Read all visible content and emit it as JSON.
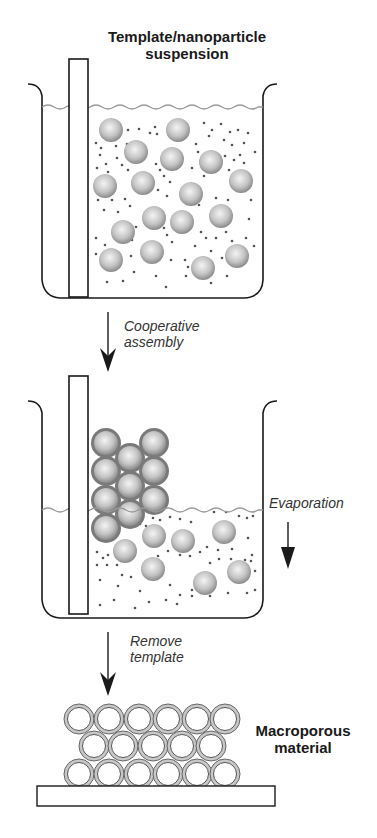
{
  "labels": {
    "suspension_line1": "Template/nanoparticle",
    "suspension_line2": "suspension",
    "step1_line1": "Cooperative",
    "step1_line2": "assembly",
    "evaporation": "Evaporation",
    "step2_line1": "Remove",
    "step2_line2": "template",
    "product_line1": "Macroporous",
    "product_line2": "material"
  },
  "colors": {
    "outline": "#1a1a1a",
    "liquid_surface": "#9a9a9a",
    "sphere_light": "#eeeeee",
    "sphere_dark": "#8c8c8c",
    "shell": "#7a7a7a",
    "dot": "#555555",
    "matrix": "#c8c8c8"
  },
  "beaker1": {
    "spheres": [
      [
        111,
        130
      ],
      [
        178,
        130
      ],
      [
        136,
        152
      ],
      [
        172,
        159
      ],
      [
        211,
        162
      ],
      [
        105,
        186
      ],
      [
        143,
        183
      ],
      [
        191,
        194
      ],
      [
        241,
        181
      ],
      [
        154,
        218
      ],
      [
        182,
        222
      ],
      [
        123,
        232
      ],
      [
        221,
        216
      ],
      [
        152,
        252
      ],
      [
        111,
        260
      ],
      [
        203,
        268
      ],
      [
        237,
        256
      ]
    ],
    "dots": [
      [
        128,
        130
      ],
      [
        139,
        129
      ],
      [
        155,
        127
      ],
      [
        150,
        133
      ],
      [
        157,
        134
      ],
      [
        204,
        123
      ],
      [
        212,
        130
      ],
      [
        221,
        124
      ],
      [
        230,
        132
      ],
      [
        238,
        130
      ],
      [
        248,
        133
      ],
      [
        96,
        143
      ],
      [
        101,
        148
      ],
      [
        116,
        146
      ],
      [
        127,
        144
      ],
      [
        196,
        144
      ],
      [
        209,
        136
      ],
      [
        224,
        140
      ],
      [
        232,
        145
      ],
      [
        244,
        143
      ],
      [
        255,
        152
      ],
      [
        100,
        155
      ],
      [
        106,
        164
      ],
      [
        117,
        158
      ],
      [
        122,
        165
      ],
      [
        156,
        164
      ],
      [
        160,
        170
      ],
      [
        198,
        152
      ],
      [
        225,
        156
      ],
      [
        234,
        160
      ],
      [
        240,
        155
      ],
      [
        244,
        163
      ],
      [
        97,
        168
      ],
      [
        108,
        172
      ],
      [
        128,
        170
      ],
      [
        164,
        176
      ],
      [
        170,
        182
      ],
      [
        192,
        168
      ],
      [
        204,
        176
      ],
      [
        229,
        170
      ],
      [
        98,
        200
      ],
      [
        112,
        200
      ],
      [
        125,
        199
      ],
      [
        130,
        206
      ],
      [
        158,
        190
      ],
      [
        167,
        196
      ],
      [
        199,
        205
      ],
      [
        216,
        198
      ],
      [
        228,
        200
      ],
      [
        251,
        200
      ],
      [
        104,
        210
      ],
      [
        118,
        212
      ],
      [
        126,
        224
      ],
      [
        136,
        227
      ],
      [
        164,
        228
      ],
      [
        167,
        235
      ],
      [
        201,
        232
      ],
      [
        206,
        238
      ],
      [
        226,
        232
      ],
      [
        249,
        219
      ],
      [
        96,
        238
      ],
      [
        105,
        245
      ],
      [
        132,
        240
      ],
      [
        172,
        242
      ],
      [
        195,
        246
      ],
      [
        216,
        238
      ],
      [
        232,
        241
      ],
      [
        246,
        238
      ],
      [
        96,
        254
      ],
      [
        131,
        256
      ],
      [
        171,
        260
      ],
      [
        185,
        260
      ],
      [
        188,
        267
      ],
      [
        211,
        251
      ],
      [
        222,
        258
      ],
      [
        254,
        246
      ],
      [
        107,
        282
      ],
      [
        123,
        281
      ],
      [
        134,
        272
      ],
      [
        156,
        276
      ],
      [
        166,
        287
      ],
      [
        186,
        276
      ],
      [
        211,
        283
      ],
      [
        227,
        276
      ]
    ]
  },
  "beaker2": {
    "shelled_spheres": [
      [
        106,
        443
      ],
      [
        154,
        443
      ],
      [
        106,
        471
      ],
      [
        154,
        471
      ],
      [
        106,
        500
      ],
      [
        154,
        500
      ],
      [
        106,
        528
      ],
      [
        130,
        458
      ],
      [
        130,
        486
      ],
      [
        130,
        514
      ]
    ],
    "spheres": [
      [
        154,
        536
      ],
      [
        183,
        541
      ],
      [
        224,
        532
      ],
      [
        125,
        551
      ],
      [
        153,
        569
      ],
      [
        205,
        583
      ],
      [
        239,
        572
      ]
    ],
    "dots": [
      [
        97,
        552
      ],
      [
        103,
        558
      ],
      [
        108,
        555
      ],
      [
        115,
        549
      ],
      [
        97,
        565
      ],
      [
        107,
        565
      ],
      [
        117,
        565
      ],
      [
        140,
        524
      ],
      [
        146,
        526
      ],
      [
        153,
        518
      ],
      [
        160,
        520
      ],
      [
        170,
        517
      ],
      [
        180,
        519
      ],
      [
        191,
        522
      ],
      [
        214,
        512
      ],
      [
        226,
        512
      ],
      [
        239,
        516
      ],
      [
        247,
        518
      ],
      [
        253,
        516
      ],
      [
        122,
        575
      ],
      [
        131,
        577
      ],
      [
        146,
        561
      ],
      [
        158,
        556
      ],
      [
        168,
        551
      ],
      [
        180,
        555
      ],
      [
        190,
        556
      ],
      [
        200,
        552
      ],
      [
        207,
        547
      ],
      [
        218,
        550
      ],
      [
        232,
        549
      ],
      [
        248,
        538
      ],
      [
        252,
        555
      ],
      [
        100,
        580
      ],
      [
        118,
        586
      ],
      [
        140,
        591
      ],
      [
        170,
        585
      ],
      [
        180,
        595
      ],
      [
        192,
        590
      ],
      [
        210,
        563
      ],
      [
        219,
        559
      ],
      [
        231,
        559
      ],
      [
        245,
        560
      ],
      [
        251,
        561
      ],
      [
        255,
        571
      ],
      [
        100,
        605
      ],
      [
        114,
        600
      ],
      [
        135,
        608
      ],
      [
        149,
        602
      ],
      [
        166,
        600
      ],
      [
        177,
        604
      ],
      [
        192,
        596
      ],
      [
        210,
        596
      ],
      [
        228,
        593
      ],
      [
        247,
        593
      ],
      [
        255,
        590
      ]
    ]
  },
  "product": {
    "rows": [
      {
        "y": 719,
        "x": [
          79,
          109,
          139,
          168,
          197,
          225
        ]
      },
      {
        "y": 746,
        "x": [
          94,
          123,
          153,
          182,
          211
        ]
      },
      {
        "y": 774,
        "x": [
          79,
          109,
          139,
          168,
          197,
          225
        ]
      }
    ]
  }
}
